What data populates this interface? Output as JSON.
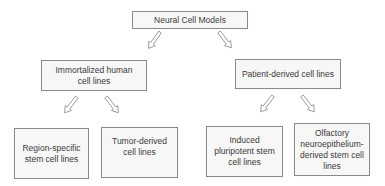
{
  "diagram": {
    "type": "hierarchy",
    "root": {
      "label": "Neural Cell Models"
    },
    "level1": [
      {
        "label": "Immortalized human cell lines"
      },
      {
        "label": "Patient-derived cell lines"
      }
    ],
    "level2": [
      {
        "parent": "Immortalized human cell lines",
        "label": "Region-specific stem cell lines"
      },
      {
        "parent": "Immortalized human cell lines",
        "label": "Tumor-derived cell lines"
      },
      {
        "parent": "Patient-derived cell lines",
        "label": "Induced pluripotent stem cell lines"
      },
      {
        "parent": "Patient-derived cell lines",
        "label": "Olfactory neuroepithelium-derived stem cell lines"
      }
    ],
    "colors": {
      "box_fill": "#f7f7f7",
      "box_border": "#8a8a8a",
      "arrow": "#9a9a9a",
      "text": "#3a3a3a"
    }
  }
}
